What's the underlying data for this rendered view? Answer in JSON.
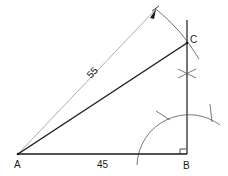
{
  "diagram": {
    "type": "geometric-construction",
    "points": {
      "A": {
        "label": "A",
        "x": 18,
        "y": 154
      },
      "B": {
        "label": "B",
        "x": 186,
        "y": 154
      },
      "C": {
        "label": "C",
        "x": 186,
        "y": 43
      }
    },
    "dimensions": {
      "hypotenuse": {
        "label": "55",
        "from": "A",
        "to": "C"
      },
      "base": {
        "label": "45",
        "from": "A",
        "to": "B"
      }
    },
    "markers": {
      "right_angle": "B"
    },
    "colors": {
      "line": "#1a1a1a",
      "construction": "#555555",
      "dimension": "#777777"
    }
  }
}
